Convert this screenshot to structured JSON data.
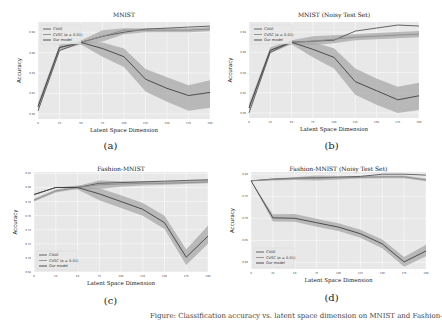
{
  "figure": {
    "caption": "Figure: Classification accuracy vs. latent space dimension on MNIST and Fashion-MNIST.",
    "legend_labels": [
      "CVAE",
      "CVSC (α = 0.01)",
      "Our model"
    ],
    "colors": {
      "plot_bg": "#e8e8e8",
      "grid": "#ffffff",
      "cvae": "#555555",
      "cvsc": "#8c8c8c",
      "ours": "#3f3f3f",
      "band": "#a8a8a8"
    }
  },
  "chart_data": [
    {
      "id": "a",
      "type": "line",
      "title": "MNIST",
      "panel_label": "(a)",
      "xlabel": "Latent Space Dimension",
      "ylabel": "Accuracy",
      "x": [
        0,
        25,
        50,
        75,
        100,
        125,
        150,
        175,
        200
      ],
      "xticks": [
        "0",
        "25",
        "50",
        "75",
        "100",
        "125",
        "150",
        "175",
        "200"
      ],
      "ylim": [
        0.895,
        0.99
      ],
      "yticks": [
        0.9,
        0.92,
        0.94,
        0.96,
        0.98
      ],
      "ytick_labels": [
        "0.90",
        "0.92",
        "0.94",
        "0.96",
        "0.98"
      ],
      "legend_position": "upper left",
      "grid": true,
      "series": [
        {
          "name": "CVAE",
          "values": [
            0.903,
            0.962,
            0.97,
            0.976,
            0.98,
            0.983,
            0.984,
            0.985,
            0.986
          ],
          "band": null
        },
        {
          "name": "CVSC (α = 0.01)",
          "values": [
            0.907,
            0.965,
            0.97,
            0.976,
            0.982,
            0.982,
            0.982,
            0.982,
            0.983
          ],
          "band": [
            [
              0.903,
              0.911
            ],
            [
              0.962,
              0.968
            ],
            [
              0.968,
              0.972
            ],
            [
              0.971,
              0.982
            ],
            [
              0.978,
              0.984
            ],
            [
              0.98,
              0.984
            ],
            [
              0.98,
              0.984
            ],
            [
              0.98,
              0.984
            ],
            [
              0.981,
              0.985
            ]
          ]
        },
        {
          "name": "Our model",
          "values": [
            0.907,
            0.965,
            0.97,
            0.964,
            0.956,
            0.934,
            0.925,
            0.918,
            0.921
          ],
          "band": [
            [
              0.907,
              0.907
            ],
            [
              0.965,
              0.965
            ],
            [
              0.968,
              0.972
            ],
            [
              0.956,
              0.97
            ],
            [
              0.946,
              0.964
            ],
            [
              0.922,
              0.944
            ],
            [
              0.912,
              0.936
            ],
            [
              0.903,
              0.928
            ],
            [
              0.906,
              0.933
            ]
          ]
        }
      ]
    },
    {
      "id": "b",
      "type": "line",
      "title": "MNIST (Noisy Test Set)",
      "panel_label": "(b)",
      "xlabel": "Latent Space Dimension",
      "ylabel": "Accuracy",
      "x": [
        0,
        25,
        50,
        75,
        100,
        125,
        150,
        175,
        200
      ],
      "xticks": [
        "0",
        "25",
        "50",
        "75",
        "100",
        "125",
        "150",
        "175",
        "200"
      ],
      "ylim": [
        0.895,
        0.99
      ],
      "yticks": [
        0.9,
        0.92,
        0.94,
        0.96,
        0.98
      ],
      "ytick_labels": [
        "0.90",
        "0.92",
        "0.94",
        "0.96",
        "0.98"
      ],
      "legend_position": "upper left",
      "grid": true,
      "series": [
        {
          "name": "CVAE",
          "values": [
            0.9,
            0.96,
            0.97,
            0.971,
            0.972,
            0.981,
            0.984,
            0.987,
            0.986
          ],
          "band": null
        },
        {
          "name": "CVSC (α = 0.01)",
          "values": [
            0.905,
            0.962,
            0.97,
            0.971,
            0.973,
            0.975,
            0.976,
            0.977,
            0.978
          ],
          "band": [
            [
              0.901,
              0.909
            ],
            [
              0.959,
              0.965
            ],
            [
              0.968,
              0.972
            ],
            [
              0.967,
              0.976
            ],
            [
              0.969,
              0.977
            ],
            [
              0.972,
              0.978
            ],
            [
              0.973,
              0.979
            ],
            [
              0.974,
              0.98
            ],
            [
              0.975,
              0.981
            ]
          ]
        },
        {
          "name": "Our model",
          "values": [
            0.905,
            0.962,
            0.97,
            0.963,
            0.955,
            0.931,
            0.922,
            0.913,
            0.917
          ],
          "band": [
            [
              0.905,
              0.905
            ],
            [
              0.962,
              0.962
            ],
            [
              0.968,
              0.972
            ],
            [
              0.955,
              0.97
            ],
            [
              0.944,
              0.964
            ],
            [
              0.918,
              0.944
            ],
            [
              0.908,
              0.934
            ],
            [
              0.9,
              0.926
            ],
            [
              0.903,
              0.93
            ]
          ]
        }
      ]
    },
    {
      "id": "c",
      "type": "line",
      "title": "Fashion-MNIST",
      "panel_label": "(c)",
      "xlabel": "Latent Space Dimension",
      "ylabel": "Accuracy",
      "x": [
        0,
        25,
        50,
        75,
        100,
        125,
        150,
        175,
        200
      ],
      "xticks": [
        "0",
        "25",
        "50",
        "75",
        "100",
        "125",
        "150",
        "175",
        "200"
      ],
      "ylim": [
        0.68,
        0.822
      ],
      "yticks": [
        0.68,
        0.7,
        0.72,
        0.74,
        0.76,
        0.78,
        0.8,
        0.82
      ],
      "ytick_labels": [
        "0.68",
        "0.70",
        "0.72",
        "0.74",
        "0.76",
        "0.78",
        "0.80",
        "0.82"
      ],
      "legend_position": "lower left",
      "grid": true,
      "series": [
        {
          "name": "CVAE",
          "values": [
            0.79,
            0.8,
            0.8,
            0.806,
            0.807,
            0.808,
            0.809,
            0.81,
            0.811
          ],
          "band": null
        },
        {
          "name": "CVSC (α = 0.01)",
          "values": [
            0.782,
            0.795,
            0.8,
            0.804,
            0.805,
            0.806,
            0.806,
            0.807,
            0.808
          ],
          "band": [
            [
              0.78,
              0.784
            ],
            [
              0.793,
              0.797
            ],
            [
              0.798,
              0.802
            ],
            [
              0.798,
              0.81
            ],
            [
              0.801,
              0.809
            ],
            [
              0.803,
              0.809
            ],
            [
              0.804,
              0.809
            ],
            [
              0.805,
              0.81
            ],
            [
              0.806,
              0.811
            ]
          ]
        },
        {
          "name": "Our model",
          "values": [
            0.79,
            0.8,
            0.8,
            0.791,
            0.78,
            0.769,
            0.75,
            0.701,
            0.731
          ],
          "band": [
            [
              0.79,
              0.79
            ],
            [
              0.8,
              0.8
            ],
            [
              0.797,
              0.803
            ],
            [
              0.782,
              0.799
            ],
            [
              0.771,
              0.789
            ],
            [
              0.76,
              0.778
            ],
            [
              0.741,
              0.76
            ],
            [
              0.69,
              0.712
            ],
            [
              0.72,
              0.746
            ]
          ]
        }
      ]
    },
    {
      "id": "d",
      "type": "line",
      "title": "Fashion-MNIST (Noisy Test Set)",
      "panel_label": "(d)",
      "xlabel": "Latent Space Dimension",
      "ylabel": "Accuracy",
      "x": [
        0,
        25,
        50,
        75,
        100,
        125,
        150,
        175,
        200
      ],
      "xticks": [
        "0",
        "25",
        "50",
        "75",
        "100",
        "125",
        "150",
        "175",
        "200"
      ],
      "ylim": [
        0.585,
        0.805
      ],
      "yticks": [
        0.6,
        0.65,
        0.7,
        0.75,
        0.8
      ],
      "ytick_labels": [
        "0.60",
        "0.65",
        "0.70",
        "0.75",
        "0.80"
      ],
      "legend_position": "lower left",
      "grid": true,
      "series": [
        {
          "name": "CVAE",
          "values": [
            0.785,
            0.789,
            0.791,
            0.792,
            0.793,
            0.795,
            0.8,
            0.8,
            0.798
          ],
          "band": null
        },
        {
          "name": "CVSC (α = 0.01)",
          "values": [
            0.785,
            0.788,
            0.79,
            0.791,
            0.792,
            0.793,
            0.794,
            0.794,
            0.787
          ],
          "band": [
            [
              0.785,
              0.785
            ],
            [
              0.786,
              0.79
            ],
            [
              0.787,
              0.793
            ],
            [
              0.786,
              0.797
            ],
            [
              0.788,
              0.796
            ],
            [
              0.79,
              0.796
            ],
            [
              0.791,
              0.797
            ],
            [
              0.791,
              0.797
            ],
            [
              0.784,
              0.79
            ]
          ]
        },
        {
          "name": "Our model",
          "values": [
            0.785,
            0.701,
            0.7,
            0.69,
            0.68,
            0.665,
            0.642,
            0.601,
            0.626
          ],
          "band": [
            [
              0.785,
              0.785
            ],
            [
              0.693,
              0.709
            ],
            [
              0.692,
              0.71
            ],
            [
              0.681,
              0.699
            ],
            [
              0.671,
              0.689
            ],
            [
              0.656,
              0.674
            ],
            [
              0.632,
              0.652
            ],
            [
              0.59,
              0.612
            ],
            [
              0.614,
              0.64
            ]
          ]
        }
      ]
    }
  ]
}
